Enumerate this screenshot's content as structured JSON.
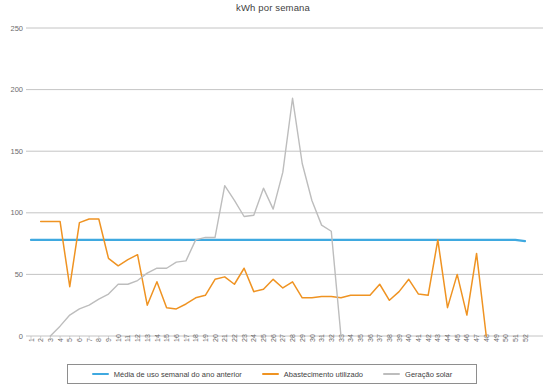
{
  "chart_data": {
    "type": "line",
    "title": "kWh por semana",
    "xlabel": "",
    "ylabel": "",
    "ylim": [
      0,
      250
    ],
    "yticks": [
      0,
      50,
      100,
      150,
      200,
      250
    ],
    "grid": true,
    "legend_position": "bottom",
    "x": [
      1,
      2,
      3,
      4,
      5,
      6,
      7,
      8,
      9,
      10,
      11,
      12,
      13,
      14,
      15,
      16,
      17,
      18,
      19,
      20,
      21,
      22,
      23,
      24,
      25,
      26,
      27,
      28,
      29,
      30,
      31,
      32,
      33,
      34,
      35,
      36,
      37,
      38,
      39,
      40,
      41,
      42,
      43,
      44,
      45,
      46,
      47,
      48,
      49,
      50,
      51,
      52
    ],
    "xticklabels": [
      "1",
      "2",
      "3",
      "4",
      "5",
      "6",
      "7",
      "8",
      "9",
      "10",
      "11",
      "12",
      "13",
      "14",
      "15",
      "16",
      "17",
      "18",
      "19",
      "20",
      "21",
      "22",
      "23",
      "24",
      "25",
      "26",
      "27",
      "28",
      "29",
      "30",
      "31",
      "32",
      "33",
      "34",
      "35",
      "36",
      "37",
      "38",
      "39",
      "40",
      "41",
      "42",
      "43",
      "44",
      "45",
      "46",
      "47",
      "48",
      "49",
      "50",
      "51",
      "52"
    ],
    "series": [
      {
        "name": "Média de uso semanal do ano anterior",
        "color": "#3fa9e0",
        "width": 2.2,
        "values": [
          78,
          78,
          78,
          78,
          78,
          78,
          78,
          78,
          78,
          78,
          78,
          78,
          78,
          78,
          78,
          78,
          78,
          78,
          78,
          78,
          78,
          78,
          78,
          78,
          78,
          78,
          78,
          78,
          78,
          78,
          78,
          78,
          78,
          78,
          78,
          78,
          78,
          78,
          78,
          78,
          78,
          78,
          78,
          78,
          78,
          78,
          78,
          78,
          78,
          78,
          78,
          77
        ]
      },
      {
        "name": "Abastecimento utilizado",
        "color": "#ef9322",
        "width": 1.5,
        "values": [
          null,
          93,
          93,
          93,
          40,
          92,
          95,
          95,
          63,
          57,
          62,
          66,
          25,
          44,
          23,
          22,
          26,
          31,
          33,
          46,
          48,
          42,
          55,
          36,
          38,
          46,
          39,
          44,
          31,
          31,
          32,
          32,
          31,
          33,
          33,
          33,
          42,
          29,
          36,
          46,
          34,
          33,
          78,
          23,
          50,
          17,
          67,
          0,
          null,
          null,
          null,
          null
        ]
      },
      {
        "name": "Geração solar",
        "color": "#bdbdbd",
        "width": 1.4,
        "values": [
          null,
          null,
          0,
          8,
          17,
          22,
          25,
          30,
          34,
          42,
          42,
          45,
          51,
          55,
          55,
          60,
          61,
          78,
          80,
          80,
          122,
          110,
          97,
          98,
          120,
          103,
          133,
          193,
          140,
          110,
          90,
          85,
          0,
          null,
          null,
          null,
          null,
          null,
          null,
          null,
          null,
          null,
          null,
          null,
          null,
          null,
          null,
          null,
          null,
          null,
          null,
          null
        ]
      }
    ]
  },
  "legend": {
    "items": [
      {
        "label": "Média de uso semanal do ano anterior",
        "color": "#3fa9e0"
      },
      {
        "label": "Abastecimento utilizado",
        "color": "#ef9322"
      },
      {
        "label": "Geração solar",
        "color": "#bdbdbd"
      }
    ]
  }
}
